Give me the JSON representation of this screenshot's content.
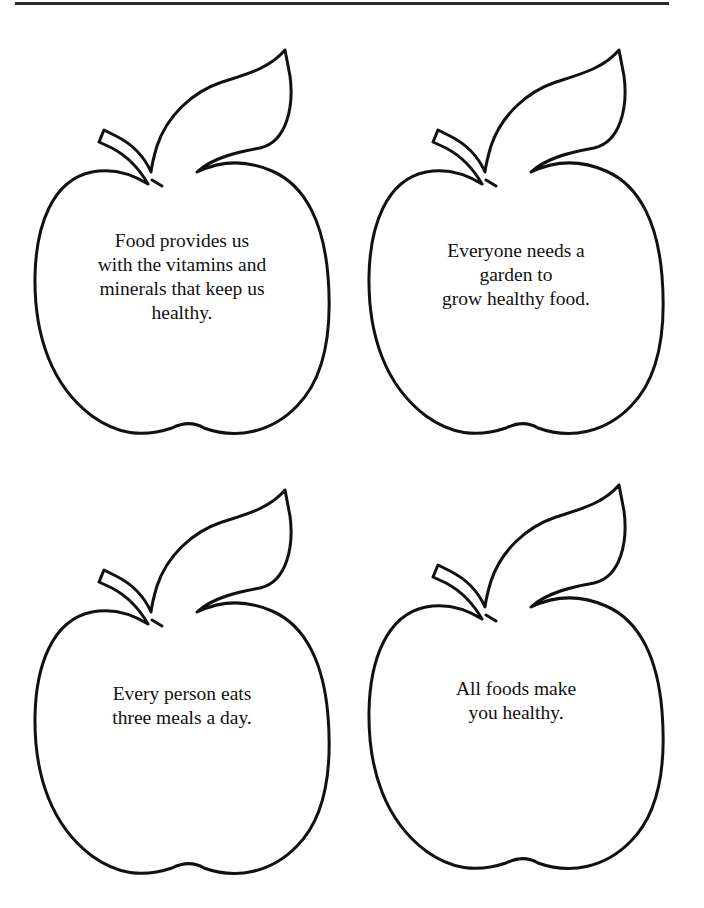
{
  "page": {
    "rule_color": "#2a2a2a",
    "outline_color": "#111111"
  },
  "cards": [
    {
      "text": "Food provides us with the vitamins and minerals that keep us healthy.",
      "lines": [
        "Food provides us",
        "with the vitamins and",
        "minerals that keep us",
        "healthy."
      ]
    },
    {
      "text": "Everyone needs a garden to grow healthy food.",
      "lines": [
        "Everyone needs a",
        "garden to",
        "grow healthy food."
      ]
    },
    {
      "text": "Every person eats three meals a day.",
      "lines": [
        "Every person eats",
        "three meals a day."
      ]
    },
    {
      "text": "All foods make you healthy.",
      "lines": [
        "All foods make",
        "you healthy."
      ]
    }
  ]
}
